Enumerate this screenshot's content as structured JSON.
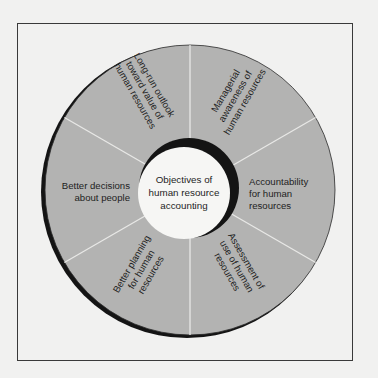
{
  "diagram": {
    "center": {
      "lines": [
        "Objectives of",
        "human resource",
        "accounting"
      ]
    },
    "segments": [
      {
        "id": "long-run-outlook",
        "lines": [
          "Long-run outlook",
          "toward value of",
          "human resources"
        ]
      },
      {
        "id": "managerial-awareness",
        "lines": [
          "Managerial",
          "awareness of",
          "human resources"
        ]
      },
      {
        "id": "accountability",
        "lines": [
          "Accountability",
          "for human",
          "resources"
        ]
      },
      {
        "id": "assessment-of-use",
        "lines": [
          "Assessment of",
          "use of human",
          "resources"
        ]
      },
      {
        "id": "better-planning",
        "lines": [
          "Better planning",
          "for human",
          "resources"
        ]
      },
      {
        "id": "better-decisions",
        "lines": [
          "Better decisions",
          "about people"
        ]
      }
    ],
    "colors": {
      "background": "#f1f1f0",
      "wheel_fill": "#b3b3b2",
      "shadow": "#141414",
      "divider": "#e8e8e6",
      "center_fill": "#f6f6f4",
      "frame": "#3a3a3a"
    }
  }
}
